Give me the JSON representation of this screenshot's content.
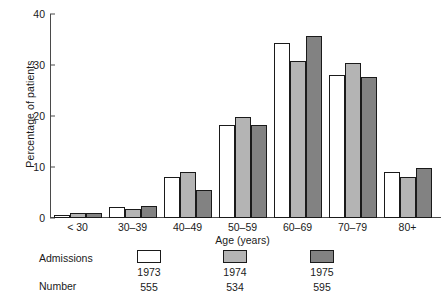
{
  "chart_data": {
    "type": "bar",
    "title": "",
    "xlabel": "Age (years)",
    "ylabel": "Percentage of patients",
    "categories": [
      "< 30",
      "30–39",
      "40–49",
      "50–59",
      "60–69",
      "70–79",
      "80+"
    ],
    "series": [
      {
        "name": "1973",
        "values": [
          0.6,
          2.2,
          8.0,
          18.2,
          34.3,
          28.1,
          9.0
        ],
        "color": "#ffffff"
      },
      {
        "name": "1974",
        "values": [
          0.9,
          1.7,
          9.0,
          19.8,
          30.7,
          30.3,
          8.0
        ],
        "color": "#b4b4b4"
      },
      {
        "name": "1975",
        "values": [
          0.9,
          2.4,
          5.5,
          18.2,
          35.7,
          27.7,
          9.8
        ],
        "color": "#828282"
      }
    ],
    "ylim": [
      0,
      40
    ],
    "yticks": [
      0,
      10,
      20,
      30,
      40
    ],
    "ytick_labels": [
      "0",
      "10",
      "20",
      "30",
      "40"
    ],
    "grid": false,
    "legend_position": "below"
  },
  "legend": {
    "row_labels": {
      "admissions": "Admissions",
      "number": "Number"
    },
    "columns": [
      {
        "year": "1973",
        "number": "555",
        "color": "#ffffff"
      },
      {
        "year": "1974",
        "number": "534",
        "color": "#b4b4b4"
      },
      {
        "year": "1975",
        "number": "595",
        "color": "#828282"
      }
    ]
  }
}
